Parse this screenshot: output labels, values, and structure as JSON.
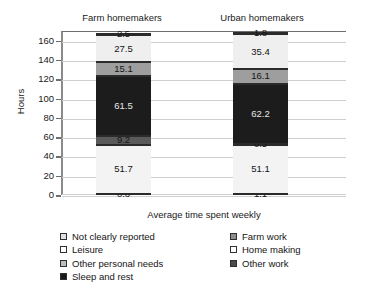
{
  "chart_data": {
    "type": "bar",
    "subtype": "stacked-bar",
    "title": "",
    "xlabel": "Average time spent weekly",
    "ylabel": "Hours",
    "categories": [
      "Farm homemakers",
      "Urban homemakers"
    ],
    "ylim": [
      0,
      170
    ],
    "yticks": [
      0,
      20,
      40,
      60,
      80,
      100,
      120,
      140,
      160
    ],
    "grid": true,
    "legend_position": "bottom",
    "stack_order_bottom_to_top": [
      "Home making",
      "Sleep and rest",
      "Other work",
      "Not clearly reported",
      "Farm work",
      "Leisure",
      "Other personal needs"
    ],
    "series": [
      {
        "name": "Home making",
        "values": [
          0.6,
          1.1
        ],
        "color": "#ffffff"
      },
      {
        "name": "Sleep and rest",
        "values": [
          51.7,
          51.1
        ],
        "color": "#f2f2f2"
      },
      {
        "name": "Other work",
        "values": [
          9.2,
          0.5
        ],
        "color": "#595959"
      },
      {
        "name": "Not clearly reported",
        "values": [
          61.5,
          62.2
        ],
        "color": "#1a1a1a"
      },
      {
        "name": "Farm work",
        "values": [
          15.1,
          16.1
        ],
        "color": "#9d9d9d"
      },
      {
        "name": "Leisure",
        "values": [
          27.5,
          35.4
        ],
        "color": "#ededed"
      },
      {
        "name": "Other personal needs",
        "values": [
          2.5,
          1.8
        ],
        "color": "#ffffff"
      }
    ],
    "totals": [
      168.1,
      168.2
    ]
  },
  "titles": {
    "farm": "Farm homemakers",
    "urban": "Urban homemakers"
  },
  "axis": {
    "ylabel": "Hours",
    "xlabel": "Average time spent weekly",
    "ytick_labels": [
      "160",
      "140",
      "120",
      "100",
      "80",
      "60",
      "40",
      "20",
      "0"
    ]
  },
  "bars": {
    "farm": {
      "label": "Farm homemakers",
      "segments": [
        {
          "name": "Other personal needs",
          "value": "2.5",
          "label_style": "dark"
        },
        {
          "name": "Leisure",
          "value": "27.5",
          "label_style": "dark"
        },
        {
          "name": "Farm work",
          "value": "15.1",
          "label_style": "dark"
        },
        {
          "name": "Not clearly reported",
          "value": "61.5",
          "label_style": "light"
        },
        {
          "name": "Other work",
          "value": "9.2",
          "label_style": "light"
        },
        {
          "name": "Sleep and rest",
          "value": "51.7",
          "label_style": "dark"
        },
        {
          "name": "Home making",
          "value": "0.6",
          "label_style": "dark"
        }
      ]
    },
    "urban": {
      "label": "Urban homemakers",
      "segments": [
        {
          "name": "Other personal needs",
          "value": "1.8",
          "label_style": "dark"
        },
        {
          "name": "Leisure",
          "value": "35.4",
          "label_style": "dark"
        },
        {
          "name": "Farm work",
          "value": "16.1",
          "label_style": "dark"
        },
        {
          "name": "Not clearly reported",
          "value": "62.2",
          "label_style": "light"
        },
        {
          "name": "Other work",
          "value": "0.5",
          "label_style": "light"
        },
        {
          "name": "Sleep and rest",
          "value": "51.1",
          "label_style": "dark"
        },
        {
          "name": "Home making",
          "value": "1.1",
          "label_style": "dark"
        }
      ]
    }
  },
  "legend": {
    "left_column": [
      {
        "label": "Not clearly reported",
        "color": "#e0e0e0"
      },
      {
        "label": "Leisure",
        "color": "#ffffff"
      },
      {
        "label": "Other personal needs",
        "color": "#bdbdbd"
      },
      {
        "label": "Sleep and rest",
        "color": "#1a1a1a"
      }
    ],
    "right_column": [
      {
        "label": "Farm work",
        "color": "#8e8e8e"
      },
      {
        "label": "Home making",
        "color": "#ffffff"
      },
      {
        "label": "Other work",
        "color": "#4a4a4a"
      }
    ]
  }
}
